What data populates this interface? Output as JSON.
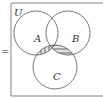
{
  "equals": "=",
  "universe_label": "U",
  "sets": [
    {
      "name": "A",
      "label": "A"
    },
    {
      "name": "B",
      "label": "B"
    },
    {
      "name": "C",
      "label": "C"
    }
  ],
  "shading": {
    "A_and_C": "vertical-lines",
    "B_and_C": "horizontal-lines",
    "A_and_B_and_C": "cross-hatch"
  },
  "colors": {
    "stroke": "#555555",
    "fill": "#e4e4e4"
  }
}
